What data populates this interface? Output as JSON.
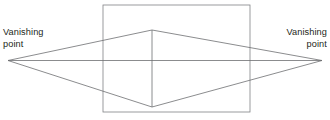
{
  "diagram": {
    "type": "two-point-perspective-construction",
    "canvas": {
      "width": 330,
      "height": 120,
      "background": "#ffffff"
    },
    "stroke": {
      "color": "#6d6e71",
      "rect_color": "#808285",
      "width": 0.8
    },
    "labels": {
      "left": {
        "line1": "Vanishing",
        "line2": "point"
      },
      "right": {
        "line1": "Vanishing",
        "line2": "point"
      }
    },
    "geometry": {
      "vanishing_point_left": {
        "x": 8,
        "y": 60.5
      },
      "vanishing_point_right": {
        "x": 322,
        "y": 60.5
      },
      "horizon_line": {
        "x1": 8,
        "y1": 60.5,
        "x2": 322,
        "y2": 60.5
      },
      "rectangle": {
        "x": 103,
        "y": 5,
        "width": 147,
        "height": 107
      },
      "apex_top": {
        "x": 152,
        "y": 30
      },
      "apex_bottom": {
        "x": 152,
        "y": 107
      },
      "center_vertical": {
        "x": 152,
        "y1": 30,
        "y2": 107
      },
      "rays": [
        {
          "name": "left-vp-to-top-apex",
          "x1": 8,
          "y1": 60.5,
          "x2": 152,
          "y2": 30
        },
        {
          "name": "top-apex-to-right-vp",
          "x1": 152,
          "y1": 30,
          "x2": 322,
          "y2": 60.5
        },
        {
          "name": "left-vp-to-bottom-apex",
          "x1": 8,
          "y1": 60.5,
          "x2": 152,
          "y2": 107
        },
        {
          "name": "bottom-apex-to-right-vp",
          "x1": 152,
          "y1": 107,
          "x2": 322,
          "y2": 60.5
        }
      ]
    }
  }
}
